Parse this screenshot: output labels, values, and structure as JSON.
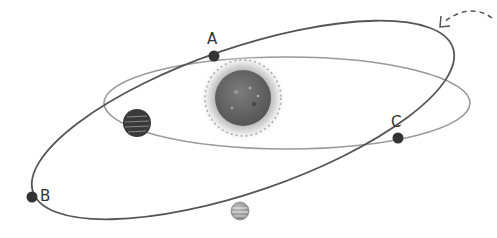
{
  "diagram": {
    "title": "",
    "colors": {
      "background": "#ffffff",
      "outer_orbit": "#555555",
      "inner_orbit": "#9a9a9a",
      "point": "#333333",
      "sun_core": "#6e6e6e",
      "sun_glow": "#bdbdbd",
      "planet_dark": "#3a3a3a",
      "planet_light": "#9c9c9c",
      "arrow": "#555555"
    },
    "labels": {
      "A": "A",
      "B": "B",
      "C": "C"
    },
    "points": [
      {
        "name": "A",
        "x": 214,
        "y": 56
      },
      {
        "name": "B",
        "x": 32,
        "y": 197
      },
      {
        "name": "C",
        "x": 398,
        "y": 138
      }
    ],
    "bodies": [
      {
        "name": "sun",
        "x": 243,
        "y": 98,
        "r": 27
      },
      {
        "name": "dark-planet",
        "x": 137,
        "y": 123,
        "r": 14
      },
      {
        "name": "light-planet",
        "x": 240,
        "y": 211,
        "r": 9
      }
    ],
    "arrow": {
      "direction": "counterclockwise",
      "note": "dashed curved arrow indicating orbital direction"
    }
  }
}
